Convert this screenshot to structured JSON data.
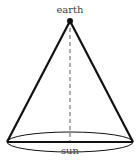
{
  "diagram": {
    "type": "cone",
    "labels": {
      "apex": "earth",
      "base": "sun"
    },
    "apex": {
      "x": 70,
      "y": 21
    },
    "base": {
      "cx": 70,
      "cy": 142,
      "rx": 63,
      "ry": 10
    },
    "colors": {
      "stroke": "#111111",
      "label": "#444444"
    }
  }
}
